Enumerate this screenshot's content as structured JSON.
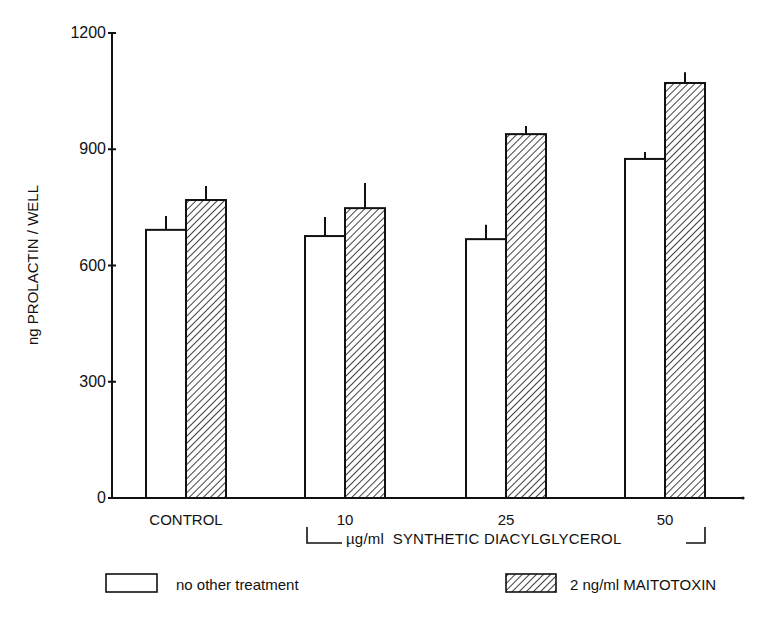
{
  "chart_data": {
    "type": "bar",
    "title": "",
    "xlabel": "µg/ml SYNTHETIC DIACYLGLYCEROL",
    "ylabel": "ng PROLACTIN / WELL",
    "ylim": [
      0,
      1200
    ],
    "yticks": [
      0,
      300,
      600,
      900,
      1200
    ],
    "grid": false,
    "legend_position": "bottom",
    "categories": [
      "CONTROL",
      "10",
      "25",
      "50"
    ],
    "series": [
      {
        "name": "no other treatment",
        "fill": "white",
        "values": [
          692,
          676,
          668,
          875
        ],
        "error_upper": [
          728,
          725,
          705,
          893
        ]
      },
      {
        "name": "2 ng/ml MAITOTOXIN",
        "fill": "hatched",
        "values": [
          769,
          748,
          939,
          1071
        ],
        "error_upper": [
          805,
          813,
          960,
          1099
        ]
      }
    ]
  },
  "axis": {
    "y_title": "ng PROLACTIN / WELL",
    "y_ticks": [
      "1200",
      "900",
      "600",
      "300",
      "0"
    ],
    "x_categories": [
      "CONTROL",
      "10",
      "25",
      "50"
    ],
    "bracket_label": "µg/ml  SYNTHETIC DIACYLGLYCEROL"
  },
  "legend": {
    "items": [
      {
        "label": "no other treatment",
        "pattern": "white"
      },
      {
        "label": "2 ng/ml MAITOTOXIN",
        "pattern": "hatched"
      }
    ]
  },
  "colors": {
    "ink": "#111111",
    "background": "#ffffff"
  }
}
